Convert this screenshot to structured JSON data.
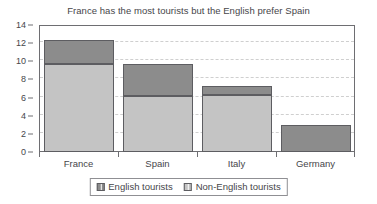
{
  "chart_data": {
    "type": "bar",
    "stacked": true,
    "title": "France has the most tourists but the English prefer Spain",
    "xlabel": "",
    "ylabel": "",
    "categories": [
      "France",
      "Spain",
      "Italy",
      "Germany"
    ],
    "series": [
      {
        "name": "Non-English tourists",
        "color": "#c4c4c4",
        "values": [
          9.7,
          6.2,
          6.3,
          0
        ]
      },
      {
        "name": "English tourists",
        "color": "#8c8c8c",
        "values": [
          2.6,
          3.5,
          1.0,
          3.0
        ]
      }
    ],
    "totals": [
      12.3,
      9.7,
      7.3,
      3.0
    ],
    "ylim": [
      0,
      14
    ],
    "ytick_labels": [
      "0",
      "2",
      "4",
      "6",
      "8",
      "10",
      "12",
      "14"
    ],
    "ytick_values": [
      0,
      2,
      4,
      6,
      8,
      10,
      12,
      14
    ],
    "grid": true,
    "grid_axis": "y",
    "legend_position": "bottom",
    "legend_entries": [
      {
        "label": "English tourists",
        "color": "#8c8c8c"
      },
      {
        "label": "Non-English tourists",
        "color": "#c4c4c4"
      }
    ]
  },
  "colors": {
    "english": "#8c8c8c",
    "non_english": "#c4c4c4",
    "axis": "#6e6e72",
    "grid": "#cfcfcf",
    "text": "#46464a",
    "background": "#ffffff"
  }
}
